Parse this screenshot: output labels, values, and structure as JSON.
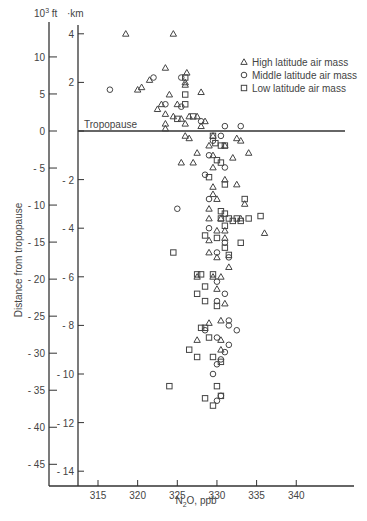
{
  "chart_data": {
    "type": "scatter",
    "title": "",
    "xlabel": "N2O, ppb",
    "ylabel": "Distance from tropopause",
    "y_units_outer": "10^3 ft",
    "y_units_inner": "km",
    "xlim": [
      312,
      345
    ],
    "ylim_km": [
      -14.5,
      5
    ],
    "x_ticks": [
      315,
      320,
      325,
      330,
      335,
      340
    ],
    "y_ticks_km": [
      4,
      2,
      0,
      -2,
      -4,
      -6,
      -8,
      -10,
      -12,
      -14
    ],
    "y_ticks_kft": [
      10,
      5,
      0,
      -5,
      -10,
      -15,
      -20,
      -25,
      -30,
      -35,
      -40,
      -45
    ],
    "annotation": "Tropopause",
    "legend": [
      {
        "marker": "triangle",
        "label": "High latitude air mass"
      },
      {
        "marker": "circle",
        "label": "Middle latitude air mass"
      },
      {
        "marker": "square",
        "label": "Low latitude air mass"
      }
    ],
    "series": [
      {
        "name": "High latitude air mass",
        "marker": "triangle",
        "points": [
          [
            318.5,
            4.0
          ],
          [
            324.5,
            4.0
          ],
          [
            323.5,
            2.6
          ],
          [
            326.2,
            2.4
          ],
          [
            326.0,
            2.0
          ],
          [
            328.0,
            1.6
          ],
          [
            321.5,
            2.1
          ],
          [
            320.0,
            1.7
          ],
          [
            320.5,
            1.8
          ],
          [
            326.0,
            1.9
          ],
          [
            324.0,
            1.5
          ],
          [
            323.0,
            1.1
          ],
          [
            325.0,
            1.1
          ],
          [
            322.5,
            0.9
          ],
          [
            323.5,
            0.7
          ],
          [
            324.5,
            0.6
          ],
          [
            325.5,
            0.5
          ],
          [
            327.5,
            0.6
          ],
          [
            326.5,
            0.6
          ],
          [
            328.5,
            0.4
          ],
          [
            326.0,
            0.3
          ],
          [
            328.0,
            0.2
          ],
          [
            323.5,
            0.1
          ],
          [
            323.5,
            0.3
          ],
          [
            326.0,
            -0.2
          ],
          [
            326.5,
            -0.3
          ],
          [
            329.0,
            -0.6
          ],
          [
            329.5,
            -0.2
          ],
          [
            331.0,
            -0.6
          ],
          [
            332.5,
            -0.3
          ],
          [
            333.0,
            -0.4
          ],
          [
            334.0,
            -0.9
          ],
          [
            327.5,
            -0.9
          ],
          [
            329.5,
            -1.0
          ],
          [
            332.0,
            -1.1
          ],
          [
            325.5,
            -1.3
          ],
          [
            327.0,
            -1.3
          ],
          [
            329.5,
            -1.5
          ],
          [
            331.0,
            -2.0
          ],
          [
            332.5,
            -2.2
          ],
          [
            333.5,
            -3.0
          ],
          [
            333.0,
            -3.6
          ],
          [
            329.5,
            -2.3
          ],
          [
            329.5,
            -2.6
          ],
          [
            330.0,
            -2.8
          ],
          [
            329.0,
            -3.2
          ],
          [
            329.0,
            -3.6
          ],
          [
            330.5,
            -3.6
          ],
          [
            330.0,
            -4.1
          ],
          [
            331.0,
            -4.4
          ],
          [
            329.0,
            -4.5
          ],
          [
            330.0,
            -5.2
          ],
          [
            331.0,
            -4.1
          ],
          [
            336.0,
            -4.2
          ],
          [
            331.5,
            -5.6
          ],
          [
            329.0,
            -5.0
          ],
          [
            330.5,
            -6.0
          ],
          [
            327.5,
            -6.0
          ],
          [
            329.5,
            -6.0
          ],
          [
            330.0,
            -6.5
          ],
          [
            331.0,
            -7.1
          ],
          [
            330.5,
            -7.8
          ],
          [
            330.5,
            -8.6
          ],
          [
            330.5,
            -9.0
          ],
          [
            327.5,
            -8.6
          ],
          [
            329.0,
            -7.9
          ]
        ]
      },
      {
        "name": "Middle latitude air mass",
        "marker": "circle",
        "points": [
          [
            316.5,
            1.7
          ],
          [
            322.0,
            2.2
          ],
          [
            325.5,
            2.2
          ],
          [
            323.5,
            1.1
          ],
          [
            325.5,
            1.0
          ],
          [
            328.0,
            0.4
          ],
          [
            331.0,
            0.2
          ],
          [
            333.0,
            0.2
          ],
          [
            330.5,
            -0.2
          ],
          [
            329.5,
            -0.4
          ],
          [
            329.0,
            -1.0
          ],
          [
            328.5,
            -1.8
          ],
          [
            331.0,
            -1.5
          ],
          [
            329.0,
            -2.8
          ],
          [
            325.0,
            -3.2
          ],
          [
            329.0,
            -4.0
          ],
          [
            331.0,
            -4.6
          ],
          [
            330.0,
            -5.0
          ],
          [
            331.5,
            -5.2
          ],
          [
            330.0,
            -6.2
          ],
          [
            331.0,
            -6.7
          ],
          [
            330.0,
            -7.0
          ],
          [
            331.5,
            -7.8
          ],
          [
            328.5,
            -8.2
          ],
          [
            330.0,
            -8.5
          ],
          [
            330.0,
            -9.6
          ],
          [
            331.5,
            -8.0
          ],
          [
            331.5,
            -8.8
          ],
          [
            329.5,
            -10.0
          ],
          [
            330.0,
            -11.1
          ],
          [
            332.5,
            -8.2
          ],
          [
            331.0,
            -9.1
          ],
          [
            330.5,
            -9.4
          ],
          [
            330.5,
            -10.9
          ]
        ]
      },
      {
        "name": "Low latitude air mass",
        "marker": "square",
        "points": [
          [
            326.0,
            2.2
          ],
          [
            326.0,
            1.5
          ],
          [
            326.0,
            1.1
          ],
          [
            327.0,
            0.6
          ],
          [
            325.0,
            0.5
          ],
          [
            329.5,
            -0.2
          ],
          [
            329.8,
            -0.5
          ],
          [
            330.5,
            -0.6
          ],
          [
            331.0,
            -0.6
          ],
          [
            330.0,
            -1.2
          ],
          [
            330.5,
            -1.3
          ],
          [
            329.0,
            -1.9
          ],
          [
            331.0,
            -2.2
          ],
          [
            333.5,
            -2.8
          ],
          [
            330.5,
            -3.3
          ],
          [
            331.0,
            -3.4
          ],
          [
            330.5,
            -3.6
          ],
          [
            331.5,
            -3.6
          ],
          [
            332.0,
            -3.7
          ],
          [
            332.5,
            -3.6
          ],
          [
            331.0,
            -3.9
          ],
          [
            334.0,
            -3.6
          ],
          [
            333.0,
            -3.7
          ],
          [
            335.5,
            -3.5
          ],
          [
            328.5,
            -4.3
          ],
          [
            330.0,
            -4.4
          ],
          [
            331.0,
            -4.8
          ],
          [
            331.5,
            -5.1
          ],
          [
            333.0,
            -4.6
          ],
          [
            324.5,
            -5.0
          ],
          [
            327.5,
            -5.9
          ],
          [
            328.0,
            -5.9
          ],
          [
            329.5,
            -5.9
          ],
          [
            328.5,
            -6.4
          ],
          [
            327.5,
            -6.7
          ],
          [
            328.5,
            -7.0
          ],
          [
            330.0,
            -7.2
          ],
          [
            328.0,
            -8.1
          ],
          [
            329.0,
            -8.5
          ],
          [
            326.5,
            -9.0
          ],
          [
            328.5,
            -8.1
          ],
          [
            327.5,
            -9.3
          ],
          [
            329.5,
            -9.3
          ],
          [
            330.5,
            -9.5
          ],
          [
            324.0,
            -10.5
          ],
          [
            328.5,
            -11.0
          ],
          [
            329.5,
            -11.3
          ],
          [
            330.0,
            -10.5
          ],
          [
            330.5,
            -10.9
          ]
        ]
      }
    ]
  }
}
